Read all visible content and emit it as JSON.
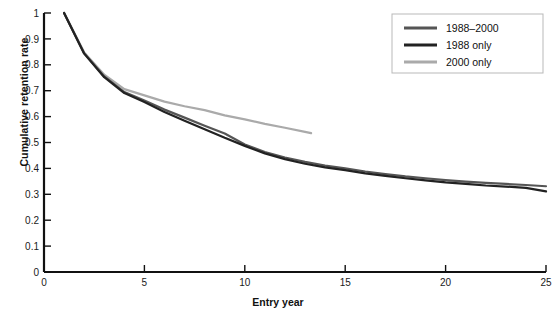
{
  "chart_data": {
    "type": "line",
    "title": "",
    "xlabel": "Entry year",
    "ylabel": "Cumulative retention rate",
    "xlim": [
      0,
      25
    ],
    "ylim": [
      0,
      1
    ],
    "grid": false,
    "legend_position": "top-right",
    "xticks": [
      "0",
      "5",
      "10",
      "15",
      "20",
      "25"
    ],
    "xtick_values": [
      0,
      5,
      10,
      15,
      20,
      25
    ],
    "yticks": [
      "0",
      "0.1",
      "0.2",
      "0.3",
      "0.4",
      "0.5",
      "0.6",
      "0.7",
      "0.8",
      "0.9",
      "1"
    ],
    "ytick_values": [
      0,
      0.1,
      0.2,
      0.3,
      0.4,
      0.5,
      0.6,
      0.7,
      0.8,
      0.9,
      1.0
    ],
    "series": [
      {
        "name": "1988–2000",
        "color": "#555555",
        "x": [
          1,
          2,
          3,
          4,
          5,
          6,
          7,
          8,
          9,
          10,
          11,
          12,
          13,
          14,
          15,
          16,
          17,
          18,
          19,
          20,
          21,
          22,
          23,
          24,
          25
        ],
        "values": [
          1.0,
          0.845,
          0.755,
          0.695,
          0.662,
          0.627,
          0.596,
          0.565,
          0.535,
          0.492,
          0.463,
          0.442,
          0.425,
          0.411,
          0.4,
          0.388,
          0.378,
          0.369,
          0.362,
          0.355,
          0.349,
          0.344,
          0.34,
          0.336,
          0.331
        ]
      },
      {
        "name": "1988 only",
        "color": "#222222",
        "x": [
          1,
          2,
          3,
          4,
          5,
          6,
          7,
          8,
          9,
          10,
          11,
          12,
          13,
          14,
          15,
          16,
          17,
          18,
          19,
          20,
          21,
          22,
          23,
          24,
          25
        ],
        "values": [
          1.0,
          0.843,
          0.752,
          0.691,
          0.656,
          0.618,
          0.584,
          0.551,
          0.518,
          0.487,
          0.458,
          0.436,
          0.418,
          0.404,
          0.393,
          0.381,
          0.371,
          0.362,
          0.354,
          0.346,
          0.34,
          0.334,
          0.33,
          0.325,
          0.311
        ]
      },
      {
        "name": "2000 only",
        "color": "#aaaaaa",
        "x": [
          1,
          2,
          3,
          4,
          5,
          6,
          7,
          8,
          9,
          10,
          11,
          12,
          13,
          13.3
        ],
        "values": [
          1.0,
          0.848,
          0.762,
          0.706,
          0.682,
          0.658,
          0.64,
          0.625,
          0.605,
          0.589,
          0.572,
          0.557,
          0.541,
          0.536
        ]
      }
    ],
    "notes": [
      "All three curves begin at 1.0 at entry year 1 and decline monotonically.",
      "The 2000 only series is truncated at entry year 13.3 and lies above the other two after year 4.",
      "The 1988 only series dips slightly below the 1988–2000 series near years 8–9 and steps up at year 10."
    ]
  },
  "legend": {
    "entries": [
      {
        "label": "1988–2000"
      },
      {
        "label": "1988 only"
      },
      {
        "label": "2000 only"
      }
    ]
  },
  "axes": {
    "x_title": "Entry year",
    "y_title": "Cumulative retention rate"
  }
}
